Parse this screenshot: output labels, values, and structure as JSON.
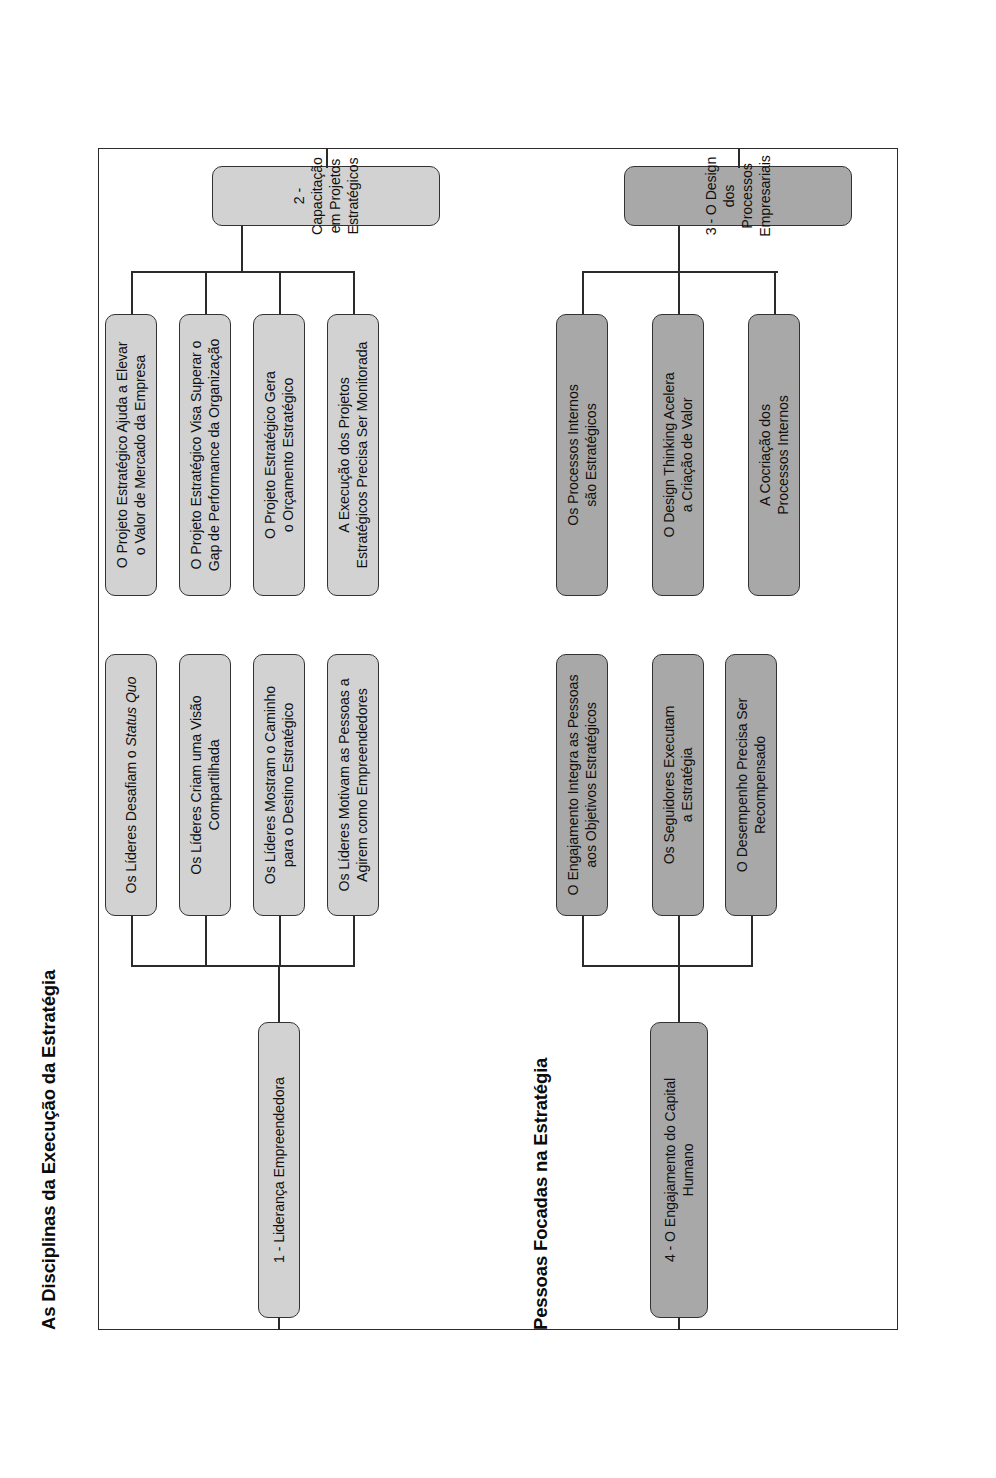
{
  "document": {
    "kind": "org-chart-diagram",
    "orientation": "rotated-90-counterclockwise",
    "background_color": "#ffffff",
    "border_color": "#2b2b2b"
  },
  "sections": [
    {
      "id": "disciplinas",
      "title": "As Disciplinas da Execução da Estratégia",
      "fill": "#d2d2d2"
    },
    {
      "id": "pessoas",
      "title": "Pessoas Focadas na Estratégia",
      "fill": "#a8a8a8"
    }
  ],
  "nodes": {
    "root1": "1 - Liderança Empreendedora",
    "root2_line1": "2 - Capacitação em Projetos",
    "root2_line2": "Estratégicos",
    "root3_line1": "3 - O Design dos Processos",
    "root3_line2": "Empresariais",
    "root4_line1": "4 - O Engajamento do Capital",
    "root4_line2": "Humano"
  },
  "branch_lideranca": {
    "items": [
      {
        "pre": "Os Líderes Desafiam o ",
        "em": "Status Quo",
        "post": ""
      },
      {
        "line1": "Os Líderes Criam uma Visão",
        "line2": "Compartilhada"
      },
      {
        "line1": "Os Líderes Mostram o Caminho",
        "line2": "para o Destino Estratégico"
      },
      {
        "line1": "Os Líderes Motivam as Pessoas a",
        "line2": "Agirem como Empreendedores"
      }
    ]
  },
  "branch_projetos": {
    "items": [
      {
        "line1": "O Projeto Estratégico Ajuda a Elevar",
        "line2": "o Valor de Mercado da Empresa"
      },
      {
        "line1": "O Projeto Estratégico Visa Superar o",
        "line2": "Gap de Performance da Organização"
      },
      {
        "line1": "O Projeto Estratégico Gera",
        "line2": "o Orçamento Estratégico"
      },
      {
        "line1": "A Execução dos Projetos",
        "line2": "Estratégicos Precisa Ser Monitorada"
      }
    ]
  },
  "branch_engajamento": {
    "items": [
      {
        "line1": "O Engajamento Integra as Pessoas",
        "line2": "aos Objetivos Estratégicos"
      },
      {
        "line1": "Os Seguidores Executam",
        "line2": "a Estratégia"
      },
      {
        "line1": "O Desempenho Precisa Ser",
        "line2": "Recompensado"
      }
    ]
  },
  "branch_processos": {
    "items": [
      {
        "line1": "Os Processos Internos",
        "line2": "são Estratégicos"
      },
      {
        "line1": "O Design Thinking Acelera",
        "line2": "a Criação de Valor"
      },
      {
        "line1": "A Cocriação dos",
        "line2": "Processos Internos"
      }
    ]
  }
}
